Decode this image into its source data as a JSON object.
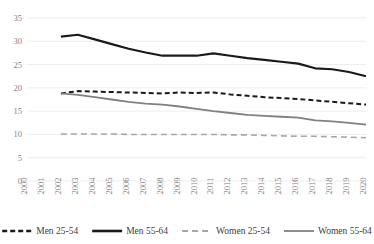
{
  "chart_data": {
    "type": "line",
    "title": "",
    "subtitle": "",
    "xlabel": "",
    "ylabel": "",
    "grid": true,
    "legend_position": "bottom",
    "ylim": [
      0,
      35
    ],
    "yticks": [
      0,
      5,
      10,
      15,
      20,
      25,
      30,
      35
    ],
    "xlim": [
      2000,
      2020
    ],
    "categories": [
      "2000",
      "2001",
      "2002",
      "2003",
      "2004",
      "2005",
      "2006",
      "2007",
      "2008",
      "2009",
      "2010",
      "2011",
      "2012",
      "2013",
      "2014",
      "2015",
      "2016",
      "2017",
      "2018",
      "2019",
      "2020"
    ],
    "x": [
      2000,
      2001,
      2002,
      2003,
      2004,
      2005,
      2006,
      2007,
      2008,
      2009,
      2010,
      2011,
      2012,
      2013,
      2014,
      2015,
      2016,
      2017,
      2018,
      2019,
      2020
    ],
    "series": [
      {
        "name": "Men 25-54",
        "color": "#1a1a1a",
        "style": "dashed",
        "width": 2.0,
        "dash": "5,3",
        "x": [
          2002,
          2003,
          2004,
          2005,
          2006,
          2007,
          2008,
          2009,
          2010,
          2011,
          2012,
          2013,
          2014,
          2015,
          2016,
          2017,
          2018,
          2019,
          2020
        ],
        "values": [
          18.8,
          19.3,
          19.2,
          19.1,
          19.0,
          18.9,
          18.8,
          19.0,
          18.9,
          19.0,
          18.6,
          18.3,
          18.0,
          17.8,
          17.6,
          17.3,
          17.0,
          16.7,
          16.4
        ]
      },
      {
        "name": "Men 55-64",
        "color": "#1a1a1a",
        "style": "solid",
        "width": 2.2,
        "dash": "",
        "x": [
          2002,
          2003,
          2004,
          2005,
          2006,
          2007,
          2008,
          2009,
          2010,
          2011,
          2012,
          2013,
          2014,
          2015,
          2016,
          2017,
          2018,
          2019,
          2020
        ],
        "values": [
          31.0,
          31.4,
          30.4,
          29.4,
          28.4,
          27.6,
          26.9,
          26.9,
          26.9,
          27.4,
          26.9,
          26.4,
          26.0,
          25.6,
          25.2,
          24.2,
          24.0,
          23.4,
          22.5
        ]
      },
      {
        "name": "Women 25-54",
        "color": "#a6a6a6",
        "style": "dashed",
        "width": 1.6,
        "dash": "6,4",
        "x": [
          2002,
          2003,
          2004,
          2005,
          2006,
          2007,
          2008,
          2009,
          2010,
          2011,
          2012,
          2013,
          2014,
          2015,
          2016,
          2017,
          2018,
          2019,
          2020
        ],
        "values": [
          10.1,
          10.1,
          10.1,
          10.1,
          10.0,
          10.0,
          10.0,
          10.0,
          10.0,
          10.0,
          9.9,
          9.9,
          9.8,
          9.7,
          9.6,
          9.6,
          9.5,
          9.4,
          9.3
        ]
      },
      {
        "name": "Women 55-64",
        "color": "#808080",
        "style": "solid",
        "width": 1.8,
        "dash": "",
        "x": [
          2002,
          2003,
          2004,
          2005,
          2006,
          2007,
          2008,
          2009,
          2010,
          2011,
          2012,
          2013,
          2014,
          2015,
          2016,
          2017,
          2018,
          2019,
          2020
        ],
        "values": [
          18.8,
          18.5,
          18.0,
          17.5,
          17.0,
          16.6,
          16.4,
          16.0,
          15.5,
          15.0,
          14.6,
          14.2,
          14.0,
          13.8,
          13.6,
          13.0,
          12.8,
          12.5,
          12.1
        ]
      }
    ],
    "legend": [
      {
        "label": "Men 25-54",
        "color": "#1a1a1a",
        "style": "dashed",
        "width": 2.4,
        "dash": "5,3"
      },
      {
        "label": "Men 55-64",
        "color": "#1a1a1a",
        "style": "solid",
        "width": 2.6,
        "dash": ""
      },
      {
        "label": "Women 25-54",
        "color": "#a6a6a6",
        "style": "dashed",
        "width": 1.8,
        "dash": "6,4"
      },
      {
        "label": "Women 55-64",
        "color": "#808080",
        "style": "solid",
        "width": 1.8,
        "dash": ""
      }
    ]
  },
  "plot": {
    "left": 27,
    "right": 366,
    "top": 18,
    "bottom": 181,
    "tick_label_y": 186,
    "legend_y": 231
  }
}
